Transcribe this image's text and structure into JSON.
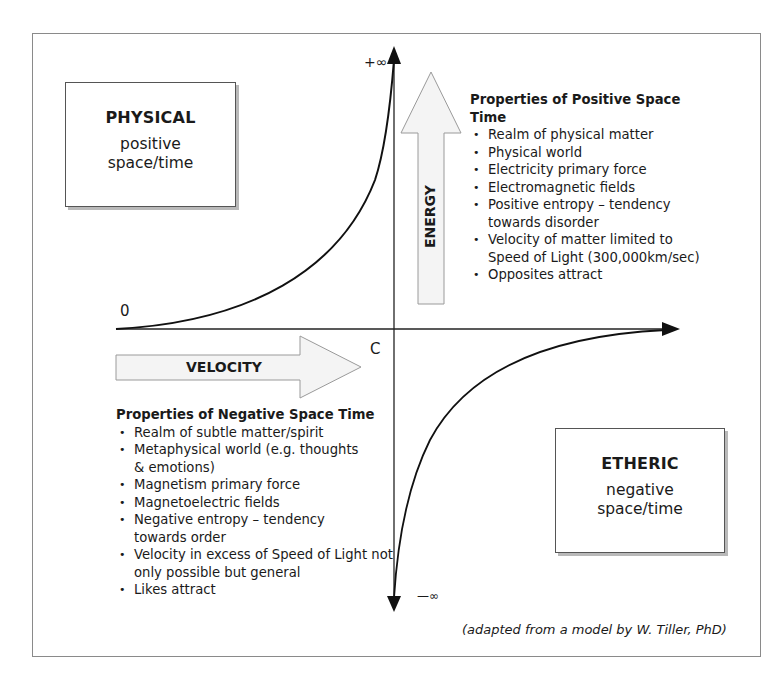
{
  "diagram": {
    "axes": {
      "top_label": "+∞",
      "bottom_label": "—∞",
      "origin_label": "0",
      "c_label": "C"
    },
    "arrows": {
      "energy_label": "ENERGY",
      "velocity_label": "VELOCITY"
    },
    "physical_box": {
      "title": "PHYSICAL",
      "line1": "positive",
      "line2": "space/time"
    },
    "etheric_box": {
      "title": "ETHERIC",
      "line1": "negative",
      "line2": "space/time"
    },
    "positive_properties": {
      "heading": "Properties of Positive Space Time",
      "items": [
        "Realm of physical matter",
        "Physical world",
        "Electricity primary force",
        "Electromagnetic fields",
        "Positive entropy – tendency towards disorder",
        "Velocity of matter limited to Speed of Light (300,000km/sec)",
        "Opposites attract"
      ]
    },
    "negative_properties": {
      "heading": "Properties of Negative Space Time",
      "items": [
        "Realm of subtle matter/spirit",
        "Metaphysical world (e.g. thoughts & emotions)",
        "Magnetism primary force",
        "Magnetoelectric fields",
        "Negative entropy – tendency towards order",
        "Velocity in excess of Speed of Light not only possible but general",
        "Likes attract"
      ]
    },
    "credit": "(adapted from a model by W. Tiller, PhD)"
  }
}
